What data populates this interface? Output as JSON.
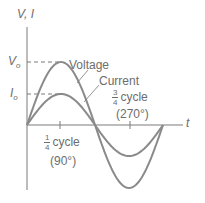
{
  "diagram": {
    "axes": {
      "y_label": "V, I",
      "x_label": "t"
    },
    "levels": {
      "voltage_peak_label": "V",
      "voltage_peak_sub": "o",
      "current_peak_label": "I",
      "current_peak_sub": "o"
    },
    "curves": [
      {
        "name": "Voltage",
        "amplitude_px": 63,
        "color": "#8a8a8a"
      },
      {
        "name": "Current",
        "amplitude_px": 31,
        "color": "#8a8a8a"
      }
    ],
    "annotations": {
      "quarter": {
        "num": "1",
        "den": "4",
        "text": "cycle",
        "angle": "(90°)"
      },
      "three_quarter": {
        "num": "3",
        "den": "4",
        "text": "cycle",
        "angle": "(270°)"
      }
    }
  }
}
